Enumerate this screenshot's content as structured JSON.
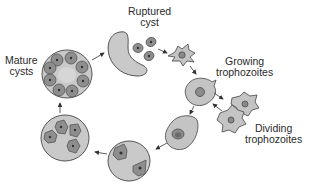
{
  "diagram": {
    "type": "life-cycle",
    "labels": {
      "ruptured_cyst": [
        "Ruptured",
        "cyst"
      ],
      "growing_trophozoites": [
        "Growing",
        "trophozoites"
      ],
      "dividing_trophozoites": [
        "Dividing",
        "trophozoites"
      ],
      "mature_cysts": [
        "Mature",
        "cysts"
      ]
    },
    "stages": [
      {
        "id": "ruptured-cyst",
        "description": "Ruptured cyst releasing three cells"
      },
      {
        "id": "released-trophozoite",
        "description": "Star-shaped trophozoite"
      },
      {
        "id": "growing-trophozoite",
        "description": "Growing trophozoite"
      },
      {
        "id": "dividing-trophozoites",
        "description": "Two dividing trophozoites"
      },
      {
        "id": "rounding-cell",
        "description": "Oval precyst cell"
      },
      {
        "id": "binucleate-cyst",
        "description": "Cyst with two nuclei"
      },
      {
        "id": "quadrinucleate-cyst",
        "description": "Cyst with four nuclei"
      },
      {
        "id": "mature-cyst",
        "description": "Mature cyst with eight nuclei"
      }
    ],
    "colors": {
      "cell_fill": "#c4c4c4",
      "cell_stroke": "#555555",
      "nucleus_fill": "#8a8a8a",
      "nucleus_dark": "#3a3a3a",
      "inner_cell_fill": "#9a9a9a",
      "arrow": "#333333",
      "text": "#2a2a2a"
    }
  }
}
